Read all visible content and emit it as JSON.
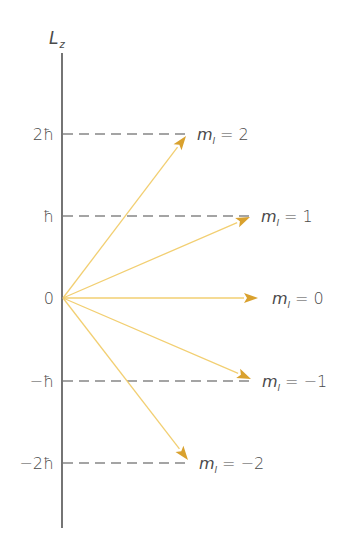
{
  "diagram": {
    "axis_label": "L",
    "axis_subscript": "z",
    "levels": [
      {
        "tick": "2ħ",
        "y": 134,
        "dash_end": 190,
        "arrow_tip": [
          186,
          136
        ],
        "label": "m",
        "sub": "l",
        "eq": "= 2",
        "label_x": 197
      },
      {
        "tick": "ħ",
        "y": 216,
        "dash_end": 252,
        "arrow_tip": [
          250,
          217
        ],
        "label": "m",
        "sub": "l",
        "eq": "= 1",
        "label_x": 261
      },
      {
        "tick": "0",
        "y": 298,
        "dash_end": null,
        "arrow_tip": [
          258,
          298
        ],
        "label": "m",
        "sub": "l",
        "eq": "= 0",
        "label_x": 272
      },
      {
        "tick": "−ħ",
        "y": 381,
        "dash_end": 252,
        "arrow_tip": [
          251,
          379
        ],
        "label": "m",
        "sub": "l",
        "eq": "= −1",
        "label_x": 262
      },
      {
        "tick": "−2ħ",
        "y": 463,
        "dash_end": 190,
        "arrow_tip": [
          188,
          460
        ],
        "label": "m",
        "sub": "l",
        "eq": "= −2",
        "label_x": 199
      }
    ],
    "colors": {
      "axis": "#3a3a3a",
      "dash": "#4a4a4a",
      "arrow_shaft": "#f2cf72",
      "arrow_head": "#d9a12e",
      "text": "#4a4a4a"
    }
  }
}
